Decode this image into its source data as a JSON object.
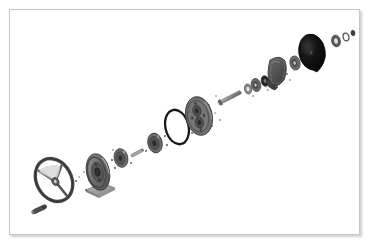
{
  "document": {
    "kind": "exploded-assembly-drawing",
    "title": "Exploded assembly view",
    "caption": "",
    "background_color": "#ffffff",
    "frame": {
      "border_color": "#c8c8c8",
      "fill_color": "#ffffff",
      "shadow_color": "#969696",
      "x": 9,
      "y": 9,
      "width": 351,
      "height": 226
    }
  },
  "palette": {
    "outline": "#3a3a3a",
    "dark_fill": "#4d4d4d",
    "mid_fill": "#7a7a7a",
    "light_fill": "#a8a8a8",
    "pale_fill": "#cfcfcf",
    "near_black": "#151515",
    "highlight": "#e8e8e8",
    "base_plate": "#9a9a9a",
    "dashed_axis": "#8c8c8c"
  },
  "assembly": {
    "axis": {
      "label": "assembly-centerline",
      "start": {
        "x": 42,
        "y": 205
      },
      "end": {
        "x": 352,
        "y": 34
      },
      "style": "implied-exploded-axis"
    },
    "parts": [
      {
        "id": "handwheel",
        "name": "handwheel",
        "label": "Handwheel / steering wheel",
        "cx": 54,
        "cy": 180,
        "rx": 17,
        "ry": 22,
        "rotation": -28,
        "ring_width": 3.2,
        "spokes": 3,
        "fill": "none",
        "stroke": "#4a4a4a"
      },
      {
        "id": "set-screw",
        "name": "set-screw",
        "label": "Set screw / taper pin",
        "cx": 40,
        "cy": 209,
        "length": 15,
        "thickness": 4,
        "rotation": -25,
        "fill": "#4d4d4d"
      },
      {
        "id": "drive-pulley",
        "name": "drive-pulley",
        "label": "Drive pulley on pedestal",
        "cx": 98,
        "cy": 172,
        "rx": 11,
        "ry": 18,
        "rotation": -12,
        "fill": "#6f6f6f",
        "hub_fill": "#4a4a4a"
      },
      {
        "id": "pedestal-base",
        "name": "pedestal-base",
        "label": "Pedestal mounting base plate",
        "cx": 100,
        "cy": 193,
        "width": 28,
        "height": 9,
        "fill": "#9a9a9a"
      },
      {
        "id": "idler-gear-a",
        "name": "idler-gear-a",
        "label": "Idler gear A",
        "cx": 121,
        "cy": 158,
        "rx": 6.5,
        "ry": 9,
        "rotation": -12,
        "fill": "#6b6b6b"
      },
      {
        "id": "spacer-shaft",
        "name": "spacer-shaft",
        "label": "Spacer shaft",
        "cx": 137,
        "cy": 153,
        "length": 12,
        "thickness": 2.6,
        "rotation": -28,
        "fill": "#9c9c9c"
      },
      {
        "id": "idler-gear-b",
        "name": "idler-gear-b",
        "label": "Idler gear B",
        "cx": 155,
        "cy": 143,
        "rx": 7,
        "ry": 9.5,
        "rotation": -12,
        "fill": "#6b6b6b"
      },
      {
        "id": "o-ring",
        "name": "o-ring",
        "label": "O-ring / drive belt",
        "cx": 177,
        "cy": 127,
        "rx": 11.5,
        "ry": 17,
        "rotation": -14,
        "ring_width": 2.2,
        "stroke": "#1d1d1d"
      },
      {
        "id": "rotor-disc",
        "name": "rotor-disc",
        "label": "Rotor disc with bolt circle",
        "cx": 199,
        "cy": 116,
        "rx": 13,
        "ry": 19,
        "rotation": -12,
        "fill": "#6e6e6e",
        "bolt_holes": 4
      },
      {
        "id": "hex-bolt",
        "name": "hex-bolt",
        "label": "Hex-head through bolt",
        "cx": 231,
        "cy": 97,
        "length": 22,
        "thickness": 3.4,
        "rotation": -27,
        "fill": "#8b8b8b"
      },
      {
        "id": "washer-1",
        "name": "washer-1",
        "label": "Flat washer 1",
        "cx": 248,
        "cy": 89,
        "rx": 3.4,
        "ry": 5,
        "fill": "#8a8a8a"
      },
      {
        "id": "spacer-collar",
        "name": "spacer-collar",
        "label": "Spacer collar",
        "cx": 256,
        "cy": 85,
        "rx": 4.6,
        "ry": 6.4,
        "fill": "#6a6a6a"
      },
      {
        "id": "lock-nut",
        "name": "lock-nut",
        "label": "Lock nut",
        "cx": 265,
        "cy": 81,
        "rx": 3.6,
        "ry": 5.2,
        "fill": "#2c2c2c"
      },
      {
        "id": "bearing-cap",
        "name": "bearing-cap",
        "label": "Bearing cap / shroud",
        "cx": 276,
        "cy": 72,
        "rx": 10,
        "ry": 14,
        "rotation": -10,
        "fill": "#5a5a5a"
      },
      {
        "id": "washer-2",
        "name": "washer-2",
        "label": "Flat washer 2",
        "cx": 295,
        "cy": 63,
        "rx": 5,
        "ry": 7,
        "fill": "#6f6f6f"
      },
      {
        "id": "drum",
        "name": "drum",
        "label": "Brake drum / end cylinder",
        "cx": 316,
        "cy": 52,
        "rx": 13,
        "ry": 18,
        "rotation": -10,
        "fill": "#0f0f0f",
        "depth": 7
      },
      {
        "id": "washer-3",
        "name": "washer-3",
        "label": "Flat washer 3",
        "cx": 336,
        "cy": 41,
        "rx": 4.2,
        "ry": 5.8,
        "fill": "#5a5a5a"
      },
      {
        "id": "washer-4",
        "name": "washer-4",
        "label": "Flat washer 4",
        "cx": 346,
        "cy": 37,
        "rx": 2.8,
        "ry": 3.8,
        "fill": "#6a6a6a"
      },
      {
        "id": "end-nut",
        "name": "end-nut",
        "label": "End nut",
        "cx": 353,
        "cy": 33,
        "rx": 1.9,
        "ry": 2.6,
        "fill": "#444444"
      }
    ],
    "callout_dots": [
      {
        "x": 76,
        "y": 181
      },
      {
        "x": 79,
        "y": 178
      },
      {
        "x": 83,
        "y": 173
      },
      {
        "x": 86,
        "y": 190
      },
      {
        "x": 113,
        "y": 160
      },
      {
        "x": 116,
        "y": 168
      },
      {
        "x": 114,
        "y": 151
      },
      {
        "x": 131,
        "y": 162
      },
      {
        "x": 146,
        "y": 150
      },
      {
        "x": 165,
        "y": 136
      },
      {
        "x": 168,
        "y": 145
      },
      {
        "x": 189,
        "y": 112
      },
      {
        "x": 193,
        "y": 132
      },
      {
        "x": 209,
        "y": 106
      },
      {
        "x": 212,
        "y": 126
      },
      {
        "x": 216,
        "y": 96
      },
      {
        "x": 220,
        "y": 120
      },
      {
        "x": 216,
        "y": 113
      },
      {
        "x": 253,
        "y": 96
      },
      {
        "x": 268,
        "y": 90
      },
      {
        "x": 271,
        "y": 86
      },
      {
        "x": 286,
        "y": 74
      },
      {
        "x": 289,
        "y": 79
      }
    ]
  }
}
